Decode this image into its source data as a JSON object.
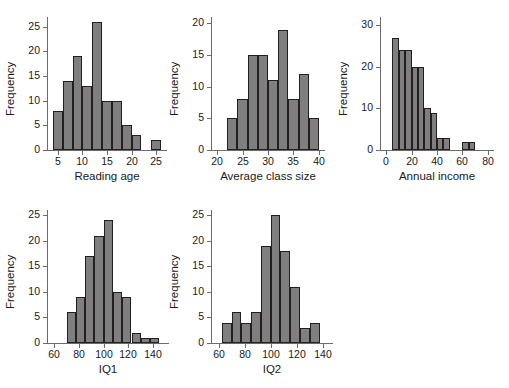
{
  "figure": {
    "background": "#ffffff",
    "bar_fill": "#7f7f7f",
    "bar_edge": "#231f20",
    "axis_color": "#6b6b6b",
    "ylabel_shared": "Frequency"
  },
  "chart_data": [
    {
      "type": "bar",
      "title": "",
      "xlabel": "Reading age",
      "ylabel": "Frequency",
      "xlim": [
        3,
        27
      ],
      "ylim": [
        0,
        27
      ],
      "xticks": [
        5,
        10,
        15,
        20,
        25
      ],
      "yticks": [
        0,
        5,
        10,
        15,
        20,
        25
      ],
      "bin_width": 2,
      "bin_starts": [
        4,
        6,
        8,
        10,
        12,
        14,
        16,
        18,
        20,
        24
      ],
      "categories": [
        "4-6",
        "6-8",
        "8-10",
        "10-12",
        "12-14",
        "14-16",
        "16-18",
        "18-20",
        "20-22",
        "24-26"
      ],
      "values": [
        8,
        14,
        19,
        13,
        26,
        10,
        10,
        5,
        3,
        2
      ],
      "grid": false,
      "legend": "none"
    },
    {
      "type": "bar",
      "title": "",
      "xlabel": "Average class size",
      "ylabel": "Frequency",
      "xlim": [
        19,
        41
      ],
      "ylim": [
        0,
        21
      ],
      "xticks": [
        20,
        25,
        30,
        35,
        40
      ],
      "yticks": [
        0,
        5,
        10,
        15,
        20
      ],
      "bin_width": 2,
      "bin_starts": [
        22,
        24,
        26,
        28,
        30,
        32,
        34,
        36,
        38
      ],
      "categories": [
        "22-24",
        "24-26",
        "26-28",
        "28-30",
        "30-32",
        "32-34",
        "34-36",
        "36-38",
        "38-40"
      ],
      "values": [
        5,
        8,
        15,
        15,
        11,
        19,
        8,
        12,
        5,
        2
      ],
      "grid": false,
      "legend": "none"
    },
    {
      "type": "bar",
      "title": "",
      "xlabel": "Annual income",
      "ylabel": "Frequency",
      "xlim": [
        -4,
        84
      ],
      "ylim": [
        0,
        32
      ],
      "xticks": [
        0,
        20,
        40,
        60,
        80
      ],
      "yticks": [
        0,
        10,
        20,
        30
      ],
      "bin_width": 5,
      "bin_starts": [
        5,
        10,
        15,
        20,
        25,
        30,
        35,
        40,
        45,
        60,
        65
      ],
      "categories": [
        "5-10",
        "10-15",
        "15-20",
        "20-25",
        "25-30",
        "30-35",
        "35-40",
        "40-45",
        "45-50",
        "60-65",
        "65-70"
      ],
      "values": [
        27,
        24,
        24,
        20,
        20,
        10,
        9,
        3,
        3,
        2,
        2
      ],
      "grid": false,
      "legend": "none"
    },
    {
      "type": "bar",
      "title": "",
      "xlabel": "IQ1",
      "ylabel": "Frequency",
      "xlim": [
        55,
        152
      ],
      "ylim": [
        0,
        26
      ],
      "xticks": [
        60,
        80,
        100,
        120,
        140
      ],
      "yticks": [
        0,
        5,
        10,
        15,
        20,
        25
      ],
      "bin_width": 7.5,
      "bin_starts": [
        70,
        77.5,
        85,
        92.5,
        100,
        107.5,
        115,
        122.5,
        130,
        137.5
      ],
      "categories": [
        "70-77.5",
        "77.5-85",
        "85-92.5",
        "92.5-100",
        "100-107.5",
        "107.5-115",
        "115-122.5",
        "122.5-130",
        "130-137.5",
        "137.5-145"
      ],
      "values": [
        6,
        9,
        17,
        21,
        24,
        10,
        9,
        2,
        1,
        1
      ],
      "grid": false,
      "legend": "none"
    },
    {
      "type": "bar",
      "title": "",
      "xlabel": "IQ2",
      "ylabel": "Frequency",
      "xlim": [
        55,
        147
      ],
      "ylim": [
        0,
        26
      ],
      "xticks": [
        60,
        80,
        100,
        120,
        140
      ],
      "yticks": [
        0,
        5,
        10,
        15,
        20,
        25
      ],
      "bin_width": 7.5,
      "bin_starts": [
        62.5,
        70,
        77.5,
        85,
        92.5,
        100,
        107.5,
        115,
        122.5,
        130
      ],
      "categories": [
        "62.5-70",
        "70-77.5",
        "77.5-85",
        "85-92.5",
        "92.5-100",
        "100-107.5",
        "107.5-115",
        "115-122.5",
        "122.5-130",
        "130-137.5"
      ],
      "values": [
        4,
        6,
        4,
        6,
        19,
        25,
        18,
        11,
        3,
        4
      ],
      "grid": false,
      "legend": "none"
    }
  ]
}
